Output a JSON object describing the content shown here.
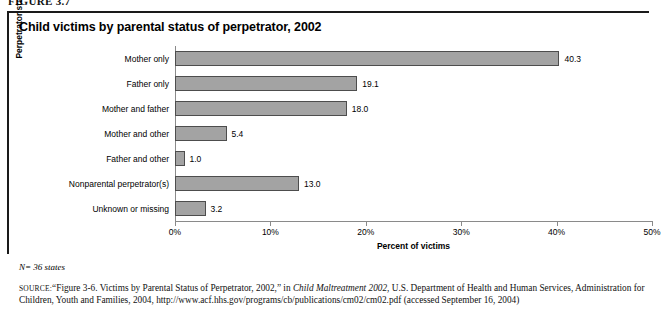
{
  "figure": {
    "label": "FIGURE 3.7"
  },
  "chart_data": {
    "type": "bar",
    "orientation": "horizontal",
    "title": "Child victims by parental status of perpetrator, 2002",
    "xlabel": "Percent of victims",
    "ylabel": "Perpetrator status",
    "categories": [
      "Mother only",
      "Father only",
      "Mother and father",
      "Mother and other",
      "Father and other",
      "Nonparental perpetrator(s)",
      "Unknown or missing"
    ],
    "values": [
      40.3,
      19.1,
      18.0,
      5.4,
      1.0,
      13.0,
      3.2
    ],
    "value_labels": [
      "40.3",
      "19.1",
      "18.0",
      "5.4",
      "1.0",
      "13.0",
      "3.2"
    ],
    "xlim": [
      0,
      50
    ],
    "xticks": [
      0,
      10,
      20,
      30,
      40,
      50
    ],
    "xtick_labels": [
      "0%",
      "10%",
      "20%",
      "30%",
      "40%",
      "50%"
    ],
    "grid": false,
    "legend": null,
    "bar_color": "#a3a3a3",
    "bar_border_color": "#4d4d4d"
  },
  "note": "N= 36 states",
  "source": {
    "prefix": "SOURCE:",
    "part1": "“Figure 3-6. Victims by Parental Status of Perpetrator, 2002,” in ",
    "italic1": "Child Maltreatment 2002",
    "part2": ", U.S. Department of Health and Human Services, Administration for Children, Youth and Families, 2004, http://www.acf.hhs.gov/programs/cb/publications/cm02/cm02.pdf (accessed September 16, 2004)"
  }
}
